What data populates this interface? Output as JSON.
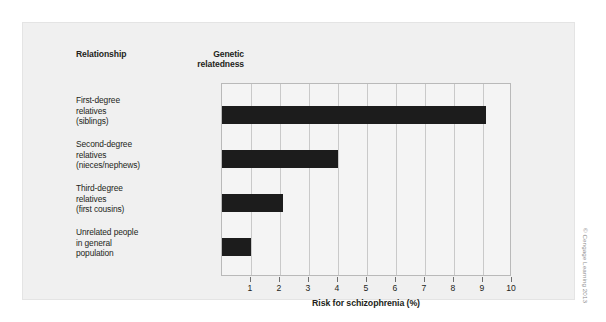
{
  "figure": {
    "credit": "© Cengage Learning 2013"
  },
  "table": {
    "header_relationship": "Relationship",
    "header_genetic_line1": "Genetic",
    "header_genetic_line2": "relatedness",
    "rows": [
      {
        "label_lines": [
          "First-degree",
          "relatives",
          "(siblings)"
        ],
        "genetic_relatedness": "50%"
      },
      {
        "label_lines": [
          "Second-degree",
          "relatives",
          "(nieces/nephews)"
        ],
        "genetic_relatedness": "25%"
      },
      {
        "label_lines": [
          "Third-degree",
          "relatives",
          "(first cousins)"
        ],
        "genetic_relatedness": "12.5%"
      },
      {
        "label_lines": [
          "Unrelated people",
          "in general",
          "population"
        ],
        "genetic_relatedness": "0%"
      }
    ]
  },
  "chart_data": {
    "type": "bar",
    "orientation": "horizontal",
    "title": "",
    "xlabel": "Risk for schizophrenia (%)",
    "ylabel": "",
    "categories": [
      "First-degree relatives (siblings)",
      "Second-degree relatives (nieces/nephews)",
      "Third-degree relatives (first cousins)",
      "Unrelated people in general population"
    ],
    "values": [
      9.1,
      4.0,
      2.1,
      1.0
    ],
    "genetic_relatedness": [
      "50%",
      "25%",
      "12.5%",
      "0%"
    ],
    "xlim": [
      0,
      10
    ],
    "xticks": [
      1,
      2,
      3,
      4,
      5,
      6,
      7,
      8,
      9,
      10
    ],
    "xtick_labels": [
      "1",
      "2",
      "3",
      "4",
      "5",
      "6",
      "7",
      "8",
      "9",
      "10"
    ],
    "grid": "vertical",
    "legend": "none",
    "bar_color": "#1c1c1c",
    "plot_background": "#f4f4f4",
    "grid_color": "#c9c9c9"
  }
}
